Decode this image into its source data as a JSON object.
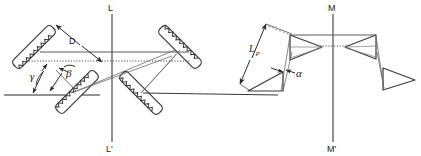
{
  "figure": {
    "domain": "optics-diagram",
    "background_color": "#ffffff",
    "line_color": "#3a3a3a",
    "ray_color": "#5a5a5a",
    "text_color": "#1a1a1a"
  },
  "axes": {
    "left": {
      "top_label": "L",
      "bottom_label": "L'",
      "x": 112,
      "y_top": 14,
      "y_bottom": 142
    },
    "right": {
      "top_label": "M",
      "bottom_label": "M'",
      "x": 333,
      "y_top": 14,
      "y_bottom": 142
    }
  },
  "labels": {
    "separation": "D",
    "gamma": "γ",
    "beta": "β",
    "prism_length_base": "L",
    "prism_length_sub": "p",
    "alpha": "α"
  },
  "left_section": {
    "name": "grating-compressor",
    "element_type": "diffraction-grating",
    "count": 4,
    "gratings": [
      {
        "id": "grating-top-left",
        "cx": 30,
        "cy": 47,
        "angle": -45,
        "length": 52,
        "width": 11
      },
      {
        "id": "grating-bottom-left",
        "cx": 74,
        "cy": 92,
        "angle": -45,
        "length": 52,
        "width": 11
      },
      {
        "id": "grating-top-right",
        "cx": 182,
        "cy": 47,
        "angle": 45,
        "length": 52,
        "width": 11
      },
      {
        "id": "grating-bottom-right",
        "cx": 143,
        "cy": 92,
        "angle": 45,
        "length": 52,
        "width": 11
      }
    ],
    "reference_line": {
      "x1": 4,
      "y1": 95,
      "x2": 100,
      "y2": 95
    }
  },
  "right_section": {
    "name": "prism-compressor",
    "element_type": "prism",
    "count": 4,
    "prisms": [
      {
        "id": "prism-1",
        "cx": 268,
        "cy": 84,
        "rotation": 0
      },
      {
        "id": "prism-2",
        "cx": 303,
        "cy": 44,
        "rotation": 0
      },
      {
        "id": "prism-3",
        "cx": 363,
        "cy": 44,
        "rotation": 180
      },
      {
        "id": "prism-4",
        "cx": 398,
        "cy": 80,
        "rotation": 180
      }
    ],
    "reference_line": {
      "x1": 150,
      "y1": 95,
      "x2": 278,
      "y2": 95
    }
  }
}
